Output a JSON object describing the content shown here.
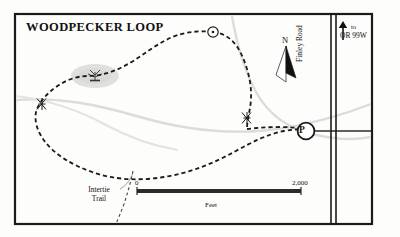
{
  "map": {
    "title": "WOODPECKER LOOP",
    "labels": {
      "north": "N",
      "finley_road": "Finley Road",
      "to_prefix": "to",
      "to_destination": "OR 99W",
      "intertie_trail_line1": "Intertie",
      "intertie_trail_line2": "Trail",
      "parking_symbol": "P"
    },
    "scale_bar": {
      "min": "0",
      "max": "2,000",
      "units": "Feet"
    },
    "icons": {
      "north_arrow": "north-arrow-icon",
      "to_highway_arrow": "up-arrow-icon",
      "parking_marker": "parking-circle-icon",
      "viewpoint_marker": "viewpoint-circle-icon",
      "trail_gate_marker": "trail-gate-icon",
      "marsh_symbol": "marsh-icon"
    },
    "colors": {
      "frame": "#1b1b1b",
      "trail_dashed": "#1b1b1b",
      "road": "#2a2a2a",
      "stream": "#d9d9d6",
      "pond_fill": "#dedede",
      "paper": "#fdfdfc",
      "scale_bar": "#2b2b2b"
    }
  }
}
